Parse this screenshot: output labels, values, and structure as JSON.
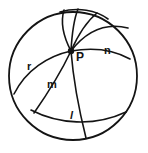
{
  "figure": {
    "background_color": "#ffffff",
    "stroke_color": "#141414",
    "labels": {
      "r": "r",
      "p": "P",
      "n": "n",
      "m": "m",
      "l": "l"
    },
    "boundary_circle": {
      "center_x": 73,
      "center_y": 76,
      "radius": 64
    },
    "point_p": {
      "x": 71,
      "y": 51,
      "radius": 3
    },
    "geodesics": [
      {
        "name": "arc-r",
        "label": "r",
        "d": "M 14 94 C 26 70, 48 56, 71 51 C 94 47, 114 50, 130 59"
      },
      {
        "name": "arc-n",
        "label": "n",
        "d": "M 71 51 C 85 33, 104 22, 128 28"
      },
      {
        "name": "arc-upper-left",
        "label": "",
        "d": "M 71 51 C 62 34, 61 20, 64 10"
      },
      {
        "name": "arc-upper-mid",
        "label": "",
        "d": "M 71 51 C 72 33, 74 19, 78 9"
      },
      {
        "name": "arc-upper-right",
        "label": "",
        "d": "M 71 51 C 78 35, 86 22, 97 13"
      },
      {
        "name": "arc-top-chord",
        "label": "",
        "d": "M 60 12 C 78 7, 96 10, 108 19"
      },
      {
        "name": "arc-m",
        "label": "m",
        "d": "M 71 51 C 62 70, 50 90, 34 113"
      },
      {
        "name": "arc-l",
        "label": "l",
        "d": "M 71 51 C 73 76, 77 102, 86 138"
      },
      {
        "name": "arc-lower-chord",
        "label": "",
        "d": "M 31 110 C 58 124, 94 127, 126 112"
      },
      {
        "name": "arc-lower-left-edge",
        "label": "",
        "d": "M 14 94 C 20 110, 28 122, 40 131"
      }
    ]
  }
}
